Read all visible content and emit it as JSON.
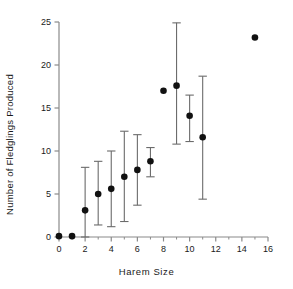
{
  "chart_data": {
    "type": "scatter",
    "title": "",
    "xlabel": "Harem Size",
    "ylabel": "Number of Fledglings Produced",
    "xlim": [
      0,
      16
    ],
    "ylim": [
      0,
      25
    ],
    "xticks": [
      0,
      2,
      4,
      6,
      8,
      10,
      12,
      14,
      16
    ],
    "xtick_labels": [
      "0",
      "2",
      "4",
      "6",
      "8",
      "10",
      "12",
      "14",
      "16"
    ],
    "xminor_step": 1,
    "yticks": [
      0,
      5,
      10,
      15,
      20,
      25
    ],
    "ytick_labels": [
      "0",
      "5",
      "10",
      "15",
      "20",
      "25"
    ],
    "grid": false,
    "legend": null,
    "marker": "filled-circle",
    "marker_color": "#111111",
    "errorbar_color": "#6b6b6b",
    "axis_color": "#8a8a8a",
    "x": [
      0,
      1,
      2,
      3,
      4,
      5,
      6,
      7,
      8,
      9,
      10,
      11,
      15
    ],
    "y": [
      0.1,
      0.1,
      3.1,
      5.0,
      5.6,
      7.0,
      7.8,
      8.8,
      17.0,
      17.6,
      14.1,
      11.6,
      23.2
    ],
    "yerr_low": [
      0.1,
      0.1,
      0.0,
      1.4,
      1.2,
      1.8,
      3.7,
      7.0,
      17.0,
      10.8,
      11.1,
      4.4,
      23.2
    ],
    "yerr_high": [
      0.1,
      0.1,
      8.1,
      8.8,
      10.0,
      12.3,
      11.9,
      10.4,
      17.0,
      24.9,
      16.5,
      18.7,
      23.2
    ],
    "points": [
      {
        "x": 0,
        "y": 0.1,
        "low": 0.1,
        "high": 0.1
      },
      {
        "x": 1,
        "y": 0.1,
        "low": 0.1,
        "high": 0.1
      },
      {
        "x": 2,
        "y": 3.1,
        "low": 0.0,
        "high": 8.1
      },
      {
        "x": 3,
        "y": 5.0,
        "low": 1.4,
        "high": 8.8
      },
      {
        "x": 4,
        "y": 5.6,
        "low": 1.2,
        "high": 10.0
      },
      {
        "x": 5,
        "y": 7.0,
        "low": 1.8,
        "high": 12.3
      },
      {
        "x": 6,
        "y": 7.8,
        "low": 3.7,
        "high": 11.9
      },
      {
        "x": 7,
        "y": 8.8,
        "low": 7.0,
        "high": 10.4
      },
      {
        "x": 8,
        "y": 17.0,
        "low": 17.0,
        "high": 17.0
      },
      {
        "x": 9,
        "y": 17.6,
        "low": 10.8,
        "high": 24.9
      },
      {
        "x": 10,
        "y": 14.1,
        "low": 11.1,
        "high": 16.5
      },
      {
        "x": 11,
        "y": 11.6,
        "low": 4.4,
        "high": 18.7
      },
      {
        "x": 15,
        "y": 23.2,
        "low": 23.2,
        "high": 23.2
      }
    ]
  }
}
